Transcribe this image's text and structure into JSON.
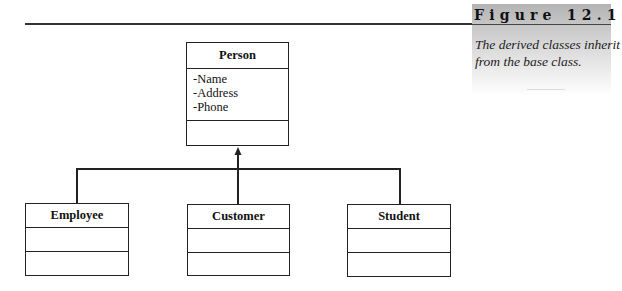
{
  "figure": {
    "heading": "Figure 12.1",
    "caption_line1": "The derived classes inherit",
    "caption_line2": "from the base class.",
    "panel_color_top": "#b4b4b4",
    "panel_color_bottom": "#ffffff"
  },
  "diagram": {
    "type": "uml-class-inheritance",
    "base_class": {
      "name": "Person",
      "attributes": [
        "-Name",
        "-Address",
        "-Phone"
      ],
      "methods": []
    },
    "derived_classes": [
      {
        "name": "Employee",
        "attributes": [],
        "methods": []
      },
      {
        "name": "Customer",
        "attributes": [],
        "methods": []
      },
      {
        "name": "Student",
        "attributes": [],
        "methods": []
      }
    ],
    "relationship": "generalization",
    "line_color": "#222222"
  }
}
